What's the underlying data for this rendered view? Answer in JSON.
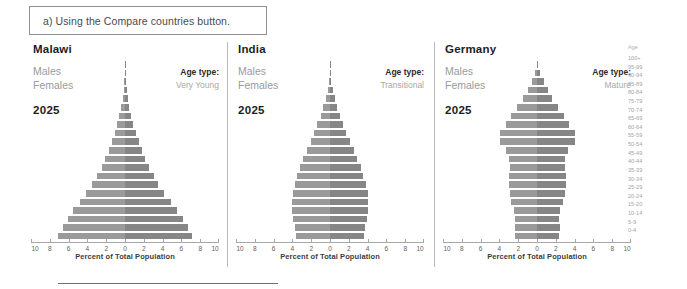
{
  "caption": {
    "text": "a) Using the Compare countries button."
  },
  "axis": {
    "title": "Percent of Total Population",
    "ticks": [
      10,
      8,
      6,
      4,
      2,
      0,
      2,
      4,
      6,
      8,
      10
    ],
    "range_percent": 10
  },
  "labels": {
    "males": "Males",
    "females": "Females",
    "age_type_label": "Age type:",
    "age_legend_header": "Age"
  },
  "age_groups": [
    "100+",
    "95-99",
    "90-94",
    "85-89",
    "80-84",
    "75-79",
    "70-74",
    "65-69",
    "60-64",
    "55-59",
    "50-54",
    "45-49",
    "40-44",
    "35-39",
    "30-34",
    "25-29",
    "20-24",
    "15-20",
    "10-14",
    "5-9",
    "0-4"
  ],
  "colors": {
    "bar": "#8d8d8d",
    "bar_left": "#9a9a9a",
    "bar_right": "#868686",
    "axis": "#a7a7a7",
    "muted_text": "#9a9a9a",
    "dark_text": "#1d1d1d"
  },
  "chart_data": [
    {
      "type": "bar",
      "title": "Malawi",
      "year": "2025",
      "age_type": "Very Young",
      "xlabel": "Percent of Total Population",
      "ylabel": "Age",
      "xlim": [
        -10,
        10
      ],
      "grid": false,
      "legend": [
        "Males",
        "Females"
      ],
      "categories": [
        "100+",
        "95-99",
        "90-94",
        "85-89",
        "80-84",
        "75-79",
        "70-74",
        "65-69",
        "60-64",
        "55-59",
        "50-54",
        "45-49",
        "40-44",
        "35-39",
        "30-34",
        "25-29",
        "20-24",
        "15-20",
        "10-14",
        "5-9",
        "0-4"
      ],
      "series": [
        {
          "name": "Males",
          "values": [
            0.02,
            0.04,
            0.08,
            0.15,
            0.25,
            0.4,
            0.6,
            0.85,
            1.1,
            1.4,
            1.75,
            2.1,
            2.5,
            3.0,
            3.5,
            4.1,
            4.8,
            5.5,
            6.1,
            6.6,
            7.1
          ]
        },
        {
          "name": "Females",
          "values": [
            0.03,
            0.05,
            0.1,
            0.18,
            0.3,
            0.45,
            0.65,
            0.9,
            1.15,
            1.45,
            1.8,
            2.15,
            2.55,
            3.05,
            3.55,
            4.15,
            4.85,
            5.55,
            6.15,
            6.65,
            7.1
          ]
        }
      ]
    },
    {
      "type": "bar",
      "title": "India",
      "year": "2025",
      "age_type": "Transitional",
      "xlabel": "Percent of Total Population",
      "ylabel": "Age",
      "xlim": [
        -10,
        10
      ],
      "grid": false,
      "legend": [
        "Males",
        "Females"
      ],
      "categories": [
        "100+",
        "95-99",
        "90-94",
        "85-89",
        "80-84",
        "75-79",
        "70-74",
        "65-69",
        "60-64",
        "55-59",
        "50-54",
        "45-49",
        "40-44",
        "35-39",
        "30-34",
        "25-29",
        "20-24",
        "15-20",
        "10-14",
        "5-9",
        "0-4"
      ],
      "series": [
        {
          "name": "Males",
          "values": [
            0.02,
            0.05,
            0.12,
            0.25,
            0.45,
            0.7,
            1.0,
            1.35,
            1.7,
            2.05,
            2.45,
            2.85,
            3.2,
            3.5,
            3.75,
            3.95,
            4.05,
            4.0,
            3.9,
            3.75,
            3.6
          ]
        },
        {
          "name": "Females",
          "values": [
            0.03,
            0.06,
            0.14,
            0.28,
            0.5,
            0.75,
            1.05,
            1.4,
            1.75,
            2.1,
            2.5,
            2.9,
            3.25,
            3.55,
            3.8,
            4.0,
            4.05,
            4.0,
            3.9,
            3.75,
            3.6
          ]
        }
      ]
    },
    {
      "type": "bar",
      "title": "Germany",
      "year": "2025",
      "age_type": "Mature",
      "xlabel": "Percent of Total Population",
      "ylabel": "Age",
      "xlim": [
        -10,
        10
      ],
      "grid": false,
      "legend": [
        "Males",
        "Females"
      ],
      "categories": [
        "100+",
        "95-99",
        "90-94",
        "85-89",
        "80-84",
        "75-79",
        "70-74",
        "65-69",
        "60-64",
        "55-59",
        "50-54",
        "45-49",
        "40-44",
        "35-39",
        "30-34",
        "25-29",
        "20-24",
        "15-20",
        "10-14",
        "5-9",
        "0-4"
      ],
      "series": [
        {
          "name": "Males",
          "values": [
            0.05,
            0.2,
            0.55,
            1.0,
            1.45,
            2.1,
            2.75,
            3.3,
            3.95,
            3.95,
            3.25,
            2.95,
            2.9,
            3.0,
            3.0,
            2.9,
            2.75,
            2.4,
            2.3,
            2.35,
            2.3
          ]
        },
        {
          "name": "Females",
          "values": [
            0.1,
            0.3,
            0.7,
            1.15,
            1.6,
            2.2,
            2.85,
            3.4,
            4.0,
            4.0,
            3.3,
            3.0,
            2.95,
            3.05,
            3.05,
            2.95,
            2.8,
            2.45,
            2.35,
            2.4,
            2.35
          ]
        }
      ]
    }
  ]
}
